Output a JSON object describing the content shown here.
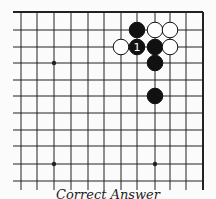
{
  "diagram": {
    "type": "go-board-fragment",
    "caption": "Correct Answer",
    "colors": {
      "background": "#fbfbfb",
      "line": "#222222",
      "black": "#111111",
      "white": "#ffffff"
    },
    "grid": {
      "x_lines": [
        21,
        37,
        54,
        71,
        88,
        104,
        121,
        137,
        155,
        170,
        186,
        203
      ],
      "y_lines": [
        12,
        30,
        47,
        63,
        80,
        96,
        113,
        130,
        146,
        164,
        181
      ],
      "left_open": true,
      "bottom_open": true,
      "top_edge": true,
      "right_edge": true
    },
    "star_points": [
      {
        "x": 54,
        "y": 63
      },
      {
        "x": 54,
        "y": 164
      },
      {
        "x": 155,
        "y": 164
      }
    ],
    "stones": [
      {
        "color": "black",
        "x": 137,
        "y": 30,
        "label": ""
      },
      {
        "color": "white",
        "x": 155,
        "y": 30,
        "label": ""
      },
      {
        "color": "white",
        "x": 170,
        "y": 30,
        "label": ""
      },
      {
        "color": "white",
        "x": 121,
        "y": 47,
        "label": ""
      },
      {
        "color": "black",
        "x": 137,
        "y": 47,
        "label": "1"
      },
      {
        "color": "black",
        "x": 155,
        "y": 47,
        "label": ""
      },
      {
        "color": "white",
        "x": 170,
        "y": 47,
        "label": ""
      },
      {
        "color": "black",
        "x": 155,
        "y": 63,
        "label": ""
      },
      {
        "color": "black",
        "x": 155,
        "y": 96,
        "label": ""
      }
    ]
  }
}
